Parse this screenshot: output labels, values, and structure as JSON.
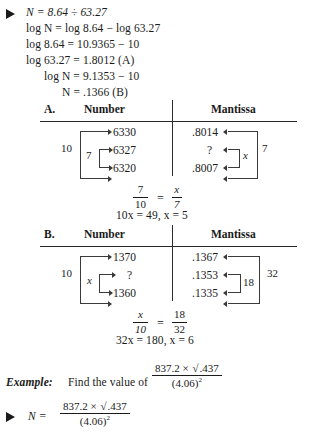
{
  "document": {
    "type": "textbook-page",
    "topic": "Logarithm interpolation"
  },
  "derivation": {
    "bullet": "triangle-bullet",
    "lines": [
      "N = 8.64 ÷ 63.27",
      "log N = log 8.64 − log 63.27",
      "log 8.64 = 10.9365 − 10",
      "log 63.27 = 1.8012   (A)",
      "log N = 9.1353 − 10",
      "N = .1366   (B)"
    ]
  },
  "tables": [
    {
      "id": "A",
      "label": "A.",
      "col_number": "Number",
      "col_mantissa": "Mantissa",
      "numbers": [
        "6330",
        "6327",
        "6320"
      ],
      "number_outer_label": "10",
      "number_inner_label": "7",
      "mantissas": [
        ".8014",
        "?",
        ".8007"
      ],
      "mantissa_outer_label": "7",
      "mantissa_inner_label": "x",
      "proportion": {
        "left_num": "7",
        "left_den": "10",
        "right_num": "x",
        "right_den": "7"
      },
      "solution": "10x = 49, x = 5"
    },
    {
      "id": "B",
      "label": "B.",
      "col_number": "Number",
      "col_mantissa": "Mantissa",
      "numbers": [
        "1370",
        "?",
        "1360"
      ],
      "number_outer_label": "10",
      "number_inner_label": "x",
      "mantissas": [
        ".1367",
        ".1353",
        ".1335"
      ],
      "mantissa_outer_label": "32",
      "mantissa_inner_label": "18",
      "proportion": {
        "left_num": "x",
        "left_den": "10",
        "right_num": "18",
        "right_den": "32"
      },
      "solution": "32x = 180, x = 6"
    }
  ],
  "example": {
    "heading": "Example:",
    "prompt": "Find the value of",
    "fraction": {
      "numerator": "837.2 × √.437",
      "numerator_plain_a": "837.2 ×",
      "numerator_radicand": ".437",
      "denominator": "(4.06)",
      "denominator_exponent": "2"
    }
  },
  "example_work": {
    "bullet": "triangle-bullet",
    "lhs": "N =",
    "fraction": {
      "numerator_plain_a": "837.2 ×",
      "numerator_radicand": ".437",
      "denominator": "(4.06)",
      "denominator_exponent": "2"
    }
  },
  "symbols": {
    "equals": "=",
    "divide": "÷",
    "minus": "−",
    "times": "×",
    "radical": "√"
  },
  "colors": {
    "ink": "#1a1a1a",
    "rule": "#2a2a2a",
    "paper": "#ffffff"
  }
}
